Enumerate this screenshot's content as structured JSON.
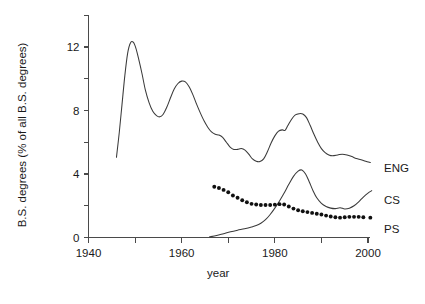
{
  "chart_data": {
    "type": "line",
    "title": "",
    "subtitle": "",
    "xlabel": "year",
    "ylabel": "B.S. degrees (% of all B.S. degrees)",
    "xlim": [
      1940,
      2002
    ],
    "ylim": [
      0,
      14
    ],
    "grid": false,
    "legend_position": "right-of-axes-inline",
    "x_ticks": [
      1940,
      1950,
      1960,
      1970,
      1980,
      1990,
      2000
    ],
    "x_tick_labels": [
      "1940",
      "",
      "1960",
      "",
      "1980",
      "",
      "2000"
    ],
    "x_minor_ticks": [
      1950,
      1970,
      1990
    ],
    "y_ticks": [
      0,
      2,
      4,
      6,
      8,
      10,
      12,
      14
    ],
    "y_tick_labels": [
      "0",
      "",
      "4",
      "",
      "8",
      "",
      "12",
      ""
    ],
    "series": [
      {
        "name": "ENG",
        "label": "ENG",
        "style": "line",
        "color": "#3a3a3a",
        "points": [
          [
            1946.0,
            5.05
          ],
          [
            1946.6,
            6.6
          ],
          [
            1947.2,
            8.4
          ],
          [
            1947.8,
            10.2
          ],
          [
            1948.4,
            11.6
          ],
          [
            1949.0,
            12.25
          ],
          [
            1949.6,
            12.3
          ],
          [
            1950.2,
            11.9
          ],
          [
            1950.8,
            11.2
          ],
          [
            1951.5,
            10.3
          ],
          [
            1952.2,
            9.3
          ],
          [
            1953.0,
            8.5
          ],
          [
            1953.8,
            7.95
          ],
          [
            1954.6,
            7.68
          ],
          [
            1955.3,
            7.6
          ],
          [
            1956.0,
            7.75
          ],
          [
            1956.8,
            8.2
          ],
          [
            1957.6,
            8.8
          ],
          [
            1958.4,
            9.35
          ],
          [
            1959.2,
            9.7
          ],
          [
            1960.0,
            9.85
          ],
          [
            1960.8,
            9.8
          ],
          [
            1961.6,
            9.5
          ],
          [
            1962.4,
            9.0
          ],
          [
            1963.2,
            8.4
          ],
          [
            1964.0,
            7.85
          ],
          [
            1964.8,
            7.35
          ],
          [
            1965.6,
            6.95
          ],
          [
            1966.4,
            6.65
          ],
          [
            1967.2,
            6.5
          ],
          [
            1968.0,
            6.45
          ],
          [
            1968.8,
            6.3
          ],
          [
            1969.6,
            6.0
          ],
          [
            1970.4,
            5.7
          ],
          [
            1971.2,
            5.55
          ],
          [
            1972.0,
            5.55
          ],
          [
            1972.8,
            5.6
          ],
          [
            1973.6,
            5.5
          ],
          [
            1974.4,
            5.25
          ],
          [
            1975.2,
            4.95
          ],
          [
            1976.0,
            4.8
          ],
          [
            1976.8,
            4.78
          ],
          [
            1977.6,
            4.95
          ],
          [
            1978.4,
            5.4
          ],
          [
            1979.2,
            5.95
          ],
          [
            1980.0,
            6.4
          ],
          [
            1980.8,
            6.7
          ],
          [
            1981.6,
            6.78
          ],
          [
            1982.2,
            6.75
          ],
          [
            1982.8,
            7.05
          ],
          [
            1983.6,
            7.45
          ],
          [
            1984.4,
            7.72
          ],
          [
            1985.2,
            7.8
          ],
          [
            1986.0,
            7.78
          ],
          [
            1986.8,
            7.55
          ],
          [
            1987.6,
            7.05
          ],
          [
            1988.4,
            6.5
          ],
          [
            1989.2,
            6.0
          ],
          [
            1990.0,
            5.6
          ],
          [
            1990.8,
            5.35
          ],
          [
            1991.6,
            5.2
          ],
          [
            1992.4,
            5.15
          ],
          [
            1993.5,
            5.2
          ],
          [
            1994.5,
            5.25
          ],
          [
            1995.5,
            5.2
          ],
          [
            1996.5,
            5.1
          ],
          [
            1997.5,
            4.98
          ],
          [
            1998.5,
            4.9
          ],
          [
            1999.5,
            4.8
          ],
          [
            2000.5,
            4.72
          ]
        ]
      },
      {
        "name": "CS",
        "label": "CS",
        "style": "line",
        "color": "#3a3a3a",
        "points": [
          [
            1966.0,
            0.04
          ],
          [
            1967.5,
            0.12
          ],
          [
            1969.0,
            0.24
          ],
          [
            1970.5,
            0.36
          ],
          [
            1972.0,
            0.46
          ],
          [
            1973.5,
            0.55
          ],
          [
            1975.0,
            0.66
          ],
          [
            1976.0,
            0.75
          ],
          [
            1977.0,
            0.9
          ],
          [
            1978.0,
            1.12
          ],
          [
            1979.0,
            1.45
          ],
          [
            1980.0,
            1.85
          ],
          [
            1981.0,
            2.3
          ],
          [
            1982.0,
            2.8
          ],
          [
            1983.0,
            3.35
          ],
          [
            1984.0,
            3.85
          ],
          [
            1985.0,
            4.18
          ],
          [
            1985.8,
            4.25
          ],
          [
            1986.6,
            4.0
          ],
          [
            1987.4,
            3.5
          ],
          [
            1988.2,
            2.95
          ],
          [
            1989.0,
            2.5
          ],
          [
            1990.0,
            2.15
          ],
          [
            1991.0,
            1.95
          ],
          [
            1992.0,
            1.85
          ],
          [
            1993.0,
            1.82
          ],
          [
            1994.0,
            1.88
          ],
          [
            1995.0,
            1.8
          ],
          [
            1996.0,
            1.85
          ],
          [
            1997.0,
            2.0
          ],
          [
            1998.0,
            2.25
          ],
          [
            1999.0,
            2.55
          ],
          [
            2000.0,
            2.8
          ],
          [
            2000.8,
            2.95
          ]
        ]
      },
      {
        "name": "PS",
        "label": "PS",
        "style": "dotted-markers",
        "color": "#101010",
        "points": [
          [
            1967.0,
            3.2
          ],
          [
            1968.0,
            3.12
          ],
          [
            1969.0,
            3.0
          ],
          [
            1970.0,
            2.85
          ],
          [
            1971.0,
            2.65
          ],
          [
            1972.0,
            2.5
          ],
          [
            1973.0,
            2.35
          ],
          [
            1974.0,
            2.22
          ],
          [
            1975.0,
            2.12
          ],
          [
            1976.0,
            2.08
          ],
          [
            1977.0,
            2.05
          ],
          [
            1978.0,
            2.05
          ],
          [
            1979.0,
            2.05
          ],
          [
            1980.0,
            2.07
          ],
          [
            1981.0,
            2.1
          ],
          [
            1982.0,
            2.08
          ],
          [
            1983.0,
            1.95
          ],
          [
            1984.0,
            1.82
          ],
          [
            1985.0,
            1.72
          ],
          [
            1986.0,
            1.65
          ],
          [
            1987.0,
            1.6
          ],
          [
            1988.0,
            1.55
          ],
          [
            1989.0,
            1.5
          ],
          [
            1990.0,
            1.45
          ],
          [
            1991.0,
            1.38
          ],
          [
            1992.0,
            1.32
          ],
          [
            1993.0,
            1.28
          ],
          [
            1994.0,
            1.25
          ],
          [
            1995.0,
            1.28
          ],
          [
            1996.0,
            1.3
          ],
          [
            1997.0,
            1.3
          ],
          [
            1998.0,
            1.3
          ],
          [
            1999.0,
            1.28
          ],
          [
            2000.5,
            1.25
          ]
        ]
      }
    ]
  },
  "axes": {
    "y_title": "B.S. degrees (% of all B.S. degrees)",
    "x_title": "year"
  },
  "labels": {
    "eng": "ENG",
    "cs": "CS",
    "ps": "PS"
  },
  "colors": {
    "line": "#3a3a3a",
    "axis": "#4a4a4a",
    "text": "#1a1a1a",
    "background": "#ffffff"
  }
}
